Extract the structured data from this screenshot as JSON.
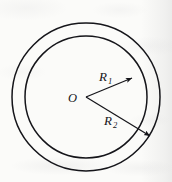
{
  "figure": {
    "background_color": "#fbfbf9",
    "stroke_color": "#15151a",
    "center": {
      "label": "O",
      "x": 86,
      "y": 97
    },
    "circles": [
      {
        "name": "outer-circle",
        "radius_label": "R2",
        "radius_px": 74,
        "stroke_width": 1.5
      },
      {
        "name": "inner-circle",
        "radius_label": "R1",
        "radius_px": 61,
        "stroke_width": 1.5
      }
    ],
    "radii": [
      {
        "name": "inner-radius",
        "label_main": "R",
        "label_sub": "1",
        "label_x": 99,
        "label_y": 80,
        "from_x": 86,
        "from_y": 97,
        "to_x": 132,
        "to_y": 78,
        "target_circle": "inner-circle",
        "arrow": true
      },
      {
        "name": "outer-radius",
        "label_main": "R",
        "label_sub": "2",
        "label_x": 105,
        "label_y": 124,
        "from_x": 86,
        "from_y": 97,
        "to_x": 150,
        "to_y": 136,
        "target_circle": "outer-circle",
        "arrow": true
      }
    ]
  }
}
